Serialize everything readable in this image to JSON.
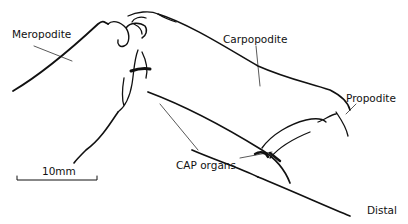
{
  "figure": {
    "type": "anatomical-line-drawing",
    "labels": {
      "meropodite": "Meropodite",
      "carpopodite": "Carpopodite",
      "propodite": "Propodite",
      "cap_organs": "CAP organs",
      "distal": "Distal"
    },
    "scale_bar": {
      "label": "10mm"
    },
    "colors": {
      "ink": "#111111",
      "background": "#ffffff"
    }
  }
}
